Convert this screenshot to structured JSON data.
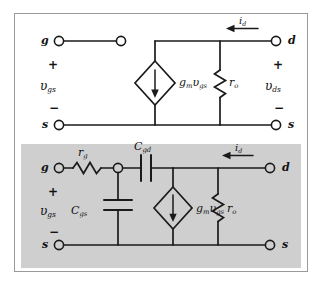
{
  "figure": {
    "border_color": "#9a9a9a",
    "panels": [
      {
        "id": "low-frequency-model",
        "name": "low-frequency-model",
        "background": "#ffffff"
      },
      {
        "id": "high-frequency-model",
        "name": "high-frequency-model",
        "background": "#cfcfcf"
      }
    ]
  },
  "low": {
    "terminals": {
      "gate": "g",
      "drain": "d",
      "source_left": "s",
      "source_right": "s"
    },
    "polarity": {
      "left_plus": "+",
      "left_minus": "−",
      "right_plus": "+",
      "right_minus": "−"
    },
    "voltages": {
      "gs_symbol": "υ",
      "gs_sub": "gs",
      "ds_symbol": "υ",
      "ds_sub": "ds"
    },
    "source": {
      "label_main": "g",
      "label_main_sub": "m",
      "label_v": "υ",
      "label_v_sub": "gs",
      "arrow_direction": "down"
    },
    "resistor": {
      "symbol": "r",
      "sub": "o"
    },
    "current": {
      "symbol": "i",
      "sub": "d",
      "arrow_direction": "left"
    }
  },
  "high": {
    "terminals": {
      "gate": "g",
      "drain": "d",
      "source_left": "s",
      "source_right": "s"
    },
    "polarity": {
      "left_plus": "+",
      "left_minus": "−",
      "right_plus": "+",
      "right_minus": "−"
    },
    "voltages": {
      "gs_symbol": "υ",
      "gs_sub": "gs",
      "ds_symbol": "υ",
      "ds_sub": "ds"
    },
    "gate_resistor": {
      "symbol": "r",
      "sub": "g"
    },
    "cap_gd": {
      "symbol": "C",
      "sub": "gd"
    },
    "cap_gs": {
      "symbol": "C",
      "sub": "gs"
    },
    "source": {
      "label_main": "g",
      "label_main_sub": "m",
      "label_v": "υ",
      "label_v_sub": "gs",
      "arrow_direction": "down"
    },
    "resistor": {
      "symbol": "r",
      "sub": "o"
    },
    "current": {
      "symbol": "i",
      "sub": "d",
      "arrow_direction": "left"
    }
  },
  "colors": {
    "wire": "#1a1a1a",
    "shaded_panel": "#cfcfcf",
    "page": "#ffffff"
  }
}
